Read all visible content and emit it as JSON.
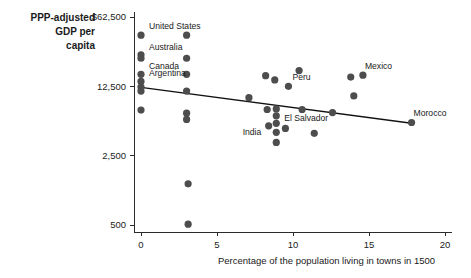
{
  "chart_data": {
    "type": "scatter",
    "title": "",
    "ylabel": "PPP-adjusted GDP per capita",
    "ylabel_lines": [
      "PPP-adjusted",
      "GDP per",
      "capita"
    ],
    "xlabel": "Percentage of the population living in towns in 1500",
    "yscale": "log",
    "ylim": [
      500,
      62500
    ],
    "xlim": [
      0,
      20
    ],
    "ytick_labels": [
      "$62,500",
      "12,500",
      "2,500",
      "500"
    ],
    "ytick_values": [
      62500,
      12500,
      2500,
      500
    ],
    "xtick_labels": [
      "0",
      "5",
      "10",
      "15",
      "20"
    ],
    "xtick_values": [
      0,
      5,
      10,
      15,
      20
    ],
    "grid": false,
    "legend": "none",
    "point_color": "#4d4d4d",
    "line_color": "#111111",
    "axis_color": "#2b2b2b",
    "trend_line": {
      "x_start": 0.0,
      "y_start": 12200,
      "x_end": 17.8,
      "y_end": 5300
    },
    "points": [
      {
        "x": 0.0,
        "y": 41000,
        "label": "United States",
        "label_dx": 8,
        "label_dy": -6
      },
      {
        "x": 0.0,
        "y": 26000,
        "label": "Australia",
        "label_dx": 8,
        "label_dy": -5
      },
      {
        "x": 0.0,
        "y": 24000,
        "label": "",
        "label_dx": 0,
        "label_dy": 0
      },
      {
        "x": 0.0,
        "y": 16500,
        "label": "Canada",
        "label_dx": 8,
        "label_dy": -5
      },
      {
        "x": 0.0,
        "y": 14000,
        "label": "Argentina",
        "label_dx": 8,
        "label_dy": -5
      },
      {
        "x": 0.0,
        "y": 12300,
        "label": "",
        "label_dx": 0,
        "label_dy": 0
      },
      {
        "x": 0.0,
        "y": 11200,
        "label": "",
        "label_dx": 0,
        "label_dy": 0
      },
      {
        "x": 0.0,
        "y": 7200,
        "label": "",
        "label_dx": 0,
        "label_dy": 0
      },
      {
        "x": 3.0,
        "y": 41000,
        "label": "",
        "label_dx": 0,
        "label_dy": 0
      },
      {
        "x": 3.0,
        "y": 24000,
        "label": "",
        "label_dx": 0,
        "label_dy": 0
      },
      {
        "x": 3.0,
        "y": 16500,
        "label": "",
        "label_dx": 0,
        "label_dy": 0
      },
      {
        "x": 3.0,
        "y": 11200,
        "label": "",
        "label_dx": 0,
        "label_dy": 0
      },
      {
        "x": 3.0,
        "y": 6700,
        "label": "",
        "label_dx": 0,
        "label_dy": 0
      },
      {
        "x": 3.0,
        "y": 5800,
        "label": "",
        "label_dx": 0,
        "label_dy": 0
      },
      {
        "x": 3.1,
        "y": 1300,
        "label": "",
        "label_dx": 0,
        "label_dy": 0
      },
      {
        "x": 3.1,
        "y": 510,
        "label": "",
        "label_dx": 0,
        "label_dy": 0
      },
      {
        "x": 7.1,
        "y": 9600,
        "label": "",
        "label_dx": 0,
        "label_dy": 0
      },
      {
        "x": 8.2,
        "y": 16000,
        "label": "",
        "label_dx": 0,
        "label_dy": 0
      },
      {
        "x": 8.3,
        "y": 7300,
        "label": "",
        "label_dx": 0,
        "label_dy": 0
      },
      {
        "x": 8.4,
        "y": 5000,
        "label": "India",
        "label_dx": -26,
        "label_dy": 9
      },
      {
        "x": 8.8,
        "y": 14500,
        "label": "",
        "label_dx": 0,
        "label_dy": 0
      },
      {
        "x": 8.9,
        "y": 7400,
        "label": "",
        "label_dx": 0,
        "label_dy": 0
      },
      {
        "x": 8.9,
        "y": 6300,
        "label": "El Salvador",
        "label_dx": 8,
        "label_dy": 5
      },
      {
        "x": 8.9,
        "y": 5300,
        "label": "",
        "label_dx": 0,
        "label_dy": 0
      },
      {
        "x": 8.9,
        "y": 4300,
        "label": "",
        "label_dx": 0,
        "label_dy": 0
      },
      {
        "x": 8.9,
        "y": 3400,
        "label": "",
        "label_dx": 0,
        "label_dy": 0
      },
      {
        "x": 9.5,
        "y": 4700,
        "label": "",
        "label_dx": 0,
        "label_dy": 0
      },
      {
        "x": 9.7,
        "y": 12500,
        "label": "Peru",
        "label_dx": 4,
        "label_dy": -6
      },
      {
        "x": 10.4,
        "y": 18000,
        "label": "",
        "label_dx": 0,
        "label_dy": 0
      },
      {
        "x": 10.6,
        "y": 7300,
        "label": "",
        "label_dx": 0,
        "label_dy": 0
      },
      {
        "x": 11.4,
        "y": 4200,
        "label": "",
        "label_dx": 0,
        "label_dy": 0
      },
      {
        "x": 12.6,
        "y": 6800,
        "label": "",
        "label_dx": 0,
        "label_dy": 0
      },
      {
        "x": 13.8,
        "y": 15500,
        "label": "",
        "label_dx": 0,
        "label_dy": 0
      },
      {
        "x": 14.6,
        "y": 16200,
        "label": "Mexico",
        "label_dx": 2,
        "label_dy": -6
      },
      {
        "x": 14.0,
        "y": 10000,
        "label": "",
        "label_dx": 0,
        "label_dy": 0
      },
      {
        "x": 17.8,
        "y": 5400,
        "label": "Morocco",
        "label_dx": 2,
        "label_dy": -6
      }
    ]
  }
}
